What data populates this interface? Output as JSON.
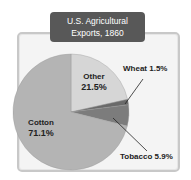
{
  "title": {
    "line1": "U.S. Agricultural",
    "line2": "Exports, 1860"
  },
  "labels": {
    "other": {
      "name": "Other",
      "pct": "21.5%"
    },
    "wheat": {
      "name": "Wheat",
      "pct": "1.5%"
    },
    "tobacco": {
      "name": "Tobacco",
      "pct": "5.9%"
    },
    "cotton": {
      "name": "Cotton",
      "pct": "71.1%"
    }
  },
  "colors": {
    "other": "#d6d6d6",
    "wheat": "#6a6a6a",
    "tobacco": "#7c7c7c",
    "cotton": "#b4b4b4",
    "title_bg": "#585858"
  },
  "chart_data": {
    "type": "pie",
    "title": "U.S. Agricultural Exports, 1860",
    "categories": [
      "Other",
      "Wheat",
      "Tobacco",
      "Cotton"
    ],
    "values": [
      21.5,
      1.5,
      5.9,
      71.1
    ],
    "unit": "%",
    "start_angle": "12 o'clock, clockwise",
    "legend": "none (direct labels)"
  }
}
